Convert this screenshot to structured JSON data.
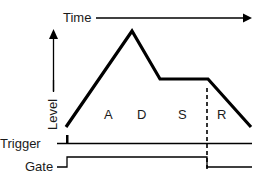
{
  "diagram": {
    "time_axis_label": "Time",
    "level_axis_label": "Level",
    "phases": [
      {
        "label": "A"
      },
      {
        "label": "D"
      },
      {
        "label": "S"
      },
      {
        "label": "R"
      }
    ],
    "signals": {
      "trigger_label": "Trigger",
      "gate_label": "Gate"
    },
    "colors": {
      "line": "#000000",
      "text": "#1a1a1a",
      "background": "#ffffff"
    }
  }
}
